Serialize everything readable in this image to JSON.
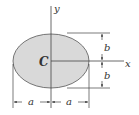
{
  "diagram": {
    "shape": "ellipse",
    "fill_color": "#d9d9d9",
    "outline_color": "#555555",
    "line_color": "#444444",
    "labels": {
      "centroid": "C",
      "x_axis": "x",
      "y_axis": "y",
      "semi_axis_horizontal": "a",
      "semi_axis_vertical": "b"
    },
    "dimensions": {
      "horizontal": [
        "a",
        "a"
      ],
      "vertical": [
        "b",
        "b"
      ]
    }
  }
}
